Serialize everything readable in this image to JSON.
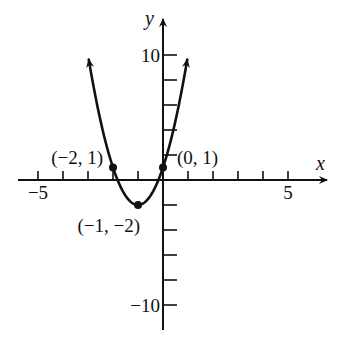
{
  "chart_data": {
    "type": "line",
    "title": "",
    "xlabel": "x",
    "ylabel": "y",
    "xlim": [
      -6,
      6.5
    ],
    "ylim": [
      -12,
      11
    ],
    "grid": false,
    "x_ticks": [
      -5,
      -4,
      -3,
      -2,
      -1,
      1,
      2,
      3,
      4,
      5
    ],
    "x_tick_labels": [
      {
        "value": -5,
        "text": "−5"
      },
      {
        "value": 5,
        "text": "5"
      }
    ],
    "y_ticks": [
      -10,
      -8,
      -6,
      -4,
      -2,
      2,
      4,
      6,
      8,
      10
    ],
    "y_tick_labels": [
      {
        "value": 10,
        "text": "10"
      },
      {
        "value": -10,
        "text": "−10"
      }
    ],
    "series": [
      {
        "name": "parabola",
        "equation": "y = 3(x + 1)^2 - 2",
        "coefficients": {
          "a": 3,
          "h": -1,
          "k": -2
        },
        "x_range": [
          -2.97,
          0.97
        ],
        "arrows_at_ends": true,
        "color": "#111111"
      }
    ],
    "points": [
      {
        "x": -2,
        "y": 1,
        "label": "(−2, 1)",
        "label_position": "upper-left"
      },
      {
        "x": -1,
        "y": -2,
        "label": "(−1, −2)",
        "label_position": "below-left"
      },
      {
        "x": 0,
        "y": 1,
        "label": "(0, 1)",
        "label_position": "upper-right"
      }
    ]
  }
}
